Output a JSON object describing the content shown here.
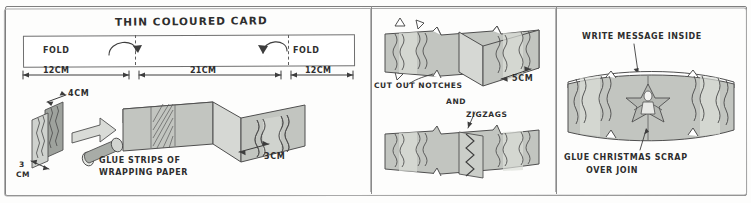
{
  "document": {
    "kind": "hand-drawn-craft-instructions",
    "panel_count": 3
  },
  "panels": {
    "left": {
      "title": "THIN COLOURED CARD",
      "fold_label_left": "FOLD",
      "fold_label_right": "FOLD",
      "dimensions": [
        {
          "value": "12CM",
          "segment": "left-flap"
        },
        {
          "value": "21CM",
          "segment": "centre"
        },
        {
          "value": "12CM",
          "segment": "right-flap"
        }
      ],
      "strip_width": "4CM",
      "strip_height_line1": "3",
      "strip_height_line2": "CM",
      "band_depth": "3CM",
      "instruction_line1": "GLUE STRIPS OF",
      "instruction_line2": "WRAPPING PAPER"
    },
    "middle": {
      "instruction_line1": "CUT OUT NOTCHES",
      "instruction_line2": "AND",
      "instruction_line3": "ZIGZAGS",
      "dimension": "5CM"
    },
    "right": {
      "top_note": "WRITE MESSAGE INSIDE",
      "bottom_line1": "GLUE CHRISTMAS SCRAP",
      "bottom_line2": "OVER JOIN"
    }
  },
  "colors": {
    "ink": "#2e2e2e",
    "frame": "#7e7e7e",
    "paper": "#fdfdfc",
    "card_fill": "#b9bcb8",
    "card_fill_light": "#d4d6d2",
    "card_fill_dark": "#9ea29d",
    "wrap_strip": "#cfd2ce",
    "zigzag_ink": "#4a4a4a"
  },
  "icons": {
    "fold_arrow_left": "curved-arrow-icon",
    "fold_arrow_right": "curved-arrow-icon",
    "transform_arrow": "block-arrow-icon",
    "pointer_left": "caret-icon",
    "pointer_right": "caret-icon",
    "leader_arrow": "leader-arrow-icon",
    "scrap_motif": "christmas-scrap-icon"
  }
}
